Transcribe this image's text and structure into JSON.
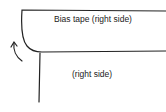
{
  "diagram": {
    "type": "sewing illustration",
    "labels": {
      "bias_tape": "Bias tape (right side)",
      "fabric": "(right side)"
    },
    "stroke_color": "#222222",
    "background": "#ffffff"
  }
}
